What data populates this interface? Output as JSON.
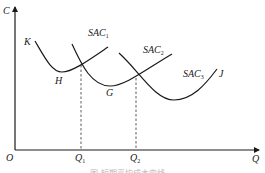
{
  "diagram": {
    "type": "cost-curves",
    "axes": {
      "y_label": "C",
      "x_label": "Q",
      "origin_label": "O"
    },
    "x_ticks": [
      {
        "label": "Q",
        "sub": "1"
      },
      {
        "label": "Q",
        "sub": "2"
      }
    ],
    "curves": [
      {
        "name": "SAC",
        "sub": "1"
      },
      {
        "name": "SAC",
        "sub": "2"
      },
      {
        "name": "SAC",
        "sub": "3"
      }
    ],
    "points": {
      "start": "K",
      "intersect_1": "H",
      "min_2": "G",
      "end": "J"
    },
    "caption": "图 短期平均成本曲线"
  },
  "colors": {
    "line": "#1a1a1a",
    "dashed": "#333333",
    "caption": "#b8b8b8"
  }
}
